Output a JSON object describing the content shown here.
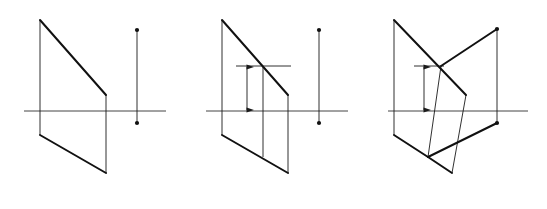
{
  "figure": {
    "kind": "descriptive-geometry-orthographic-projection",
    "background_color": "#ffffff",
    "stroke_color": "#1a1a1a",
    "thick_stroke_color": "#111111",
    "axis_color": "#444444",
    "panels": [
      {
        "id": "a",
        "caption": "(a)",
        "caption_x": 71,
        "caption_y": 190,
        "axis": {
          "left_label": "X",
          "right_label": "O",
          "left_label_x": 16,
          "right_label_x": 172,
          "label_y": 114,
          "x1": 24,
          "x2": 166,
          "y": 111
        },
        "points": [
          {
            "name": "a'",
            "x": 40,
            "y": 20,
            "label_x": 36,
            "label_y": 13,
            "dot": false
          },
          {
            "name": "b'",
            "x": 106,
            "y": 95,
            "label_x": 110,
            "label_y": 93,
            "dot": false
          },
          {
            "name": "a",
            "x": 40,
            "y": 135,
            "label_x": 33,
            "label_y": 139,
            "dot": false
          },
          {
            "name": "b",
            "x": 106,
            "y": 173,
            "label_x": 110,
            "label_y": 178,
            "dot": false
          },
          {
            "name": "c'",
            "x": 137,
            "y": 30,
            "label_x": 142,
            "label_y": 26,
            "dot": true
          },
          {
            "name": "c",
            "x": 137,
            "y": 123,
            "label_x": 142,
            "label_y": 128,
            "dot": true
          }
        ],
        "thick_segments": [
          {
            "from": "a'",
            "to": "b'"
          },
          {
            "from": "a",
            "to": "b"
          }
        ],
        "thin_segments": [
          {
            "from": "a'",
            "to": "a"
          },
          {
            "from": "b'",
            "to": "b"
          },
          {
            "from": "c'",
            "to": "c"
          }
        ],
        "dimension": null
      },
      {
        "id": "b",
        "caption": "(b)",
        "caption_x": 253,
        "caption_y": 190,
        "axis": {
          "left_label": "X",
          "right_label": "O",
          "left_label_x": 198,
          "right_label_x": 354,
          "label_y": 114,
          "x1": 206,
          "x2": 348,
          "y": 111
        },
        "points": [
          {
            "name": "a'",
            "x": 222,
            "y": 20,
            "label_x": 218,
            "label_y": 13,
            "dot": false
          },
          {
            "name": "b'",
            "x": 288,
            "y": 95,
            "label_x": 292,
            "label_y": 93,
            "dot": false
          },
          {
            "name": "d'",
            "x": 263,
            "y": 66,
            "label_x": 267,
            "label_y": 61,
            "dot": false
          },
          {
            "name": "a",
            "x": 222,
            "y": 135,
            "label_x": 215,
            "label_y": 139,
            "dot": false
          },
          {
            "name": "b",
            "x": 288,
            "y": 173,
            "label_x": 292,
            "label_y": 178,
            "dot": false
          },
          {
            "name": "d",
            "x": 263,
            "y": 157,
            "label_x": 259,
            "label_y": 167,
            "dot": false
          },
          {
            "name": "c'",
            "x": 319,
            "y": 30,
            "label_x": 324,
            "label_y": 26,
            "dot": true
          },
          {
            "name": "c",
            "x": 319,
            "y": 123,
            "label_x": 324,
            "label_y": 128,
            "dot": true
          }
        ],
        "thick_segments": [
          {
            "from": "a'",
            "to": "b'"
          },
          {
            "from": "a",
            "to": "b"
          }
        ],
        "thin_segments": [
          {
            "from": "a'",
            "to": "a"
          },
          {
            "from": "b'",
            "to": "b"
          },
          {
            "from": "c'",
            "to": "c"
          },
          {
            "from": "d'",
            "to": "d"
          }
        ],
        "dimension": {
          "value": "20",
          "reference_line": {
            "x1": 236,
            "x2": 291,
            "y": 66
          },
          "arrow_x": 247,
          "arrow_y_top": 66,
          "arrow_y_bottom": 111,
          "text_x": 243,
          "text_y": 91
        }
      },
      {
        "id": "c",
        "caption": "(c)",
        "caption_x": 435,
        "caption_y": 190,
        "axis": {
          "left_label": "X",
          "right_label": "O",
          "left_label_x": 380,
          "right_label_x": 534,
          "label_y": 114,
          "x1": 388,
          "x2": 528,
          "y": 111
        },
        "points": [
          {
            "name": "a'",
            "x": 394,
            "y": 20,
            "label_x": 390,
            "label_y": 13,
            "dot": false
          },
          {
            "name": "b'",
            "x": 466,
            "y": 95,
            "label_x": 470,
            "label_y": 93,
            "dot": false
          },
          {
            "name": "d'",
            "x": 441,
            "y": 66,
            "label_x": 445,
            "label_y": 61,
            "dot": false
          },
          {
            "name": "a",
            "x": 394,
            "y": 135,
            "label_x": 387,
            "label_y": 139,
            "dot": false
          },
          {
            "name": "b",
            "x": 452,
            "y": 173,
            "label_x": 456,
            "label_y": 178,
            "dot": false
          },
          {
            "name": "d",
            "x": 428,
            "y": 157,
            "label_x": 424,
            "label_y": 167,
            "dot": false
          },
          {
            "name": "c'",
            "x": 497,
            "y": 29,
            "label_x": 502,
            "label_y": 25,
            "dot": true
          },
          {
            "name": "c",
            "x": 497,
            "y": 123,
            "label_x": 502,
            "label_y": 128,
            "dot": true
          }
        ],
        "thick_segments": [
          {
            "from": "a'",
            "to": "b'"
          },
          {
            "from": "d'",
            "to": "c'"
          },
          {
            "from": "a",
            "to": "d"
          },
          {
            "from": "d",
            "to": "b"
          },
          {
            "from": "d",
            "to": "c"
          }
        ],
        "thin_segments": [
          {
            "from": "a'",
            "to": "a"
          },
          {
            "from": "b'",
            "to": "b"
          },
          {
            "from": "c'",
            "to": "c"
          },
          {
            "from": "d'",
            "to": "d"
          }
        ],
        "dimension": {
          "value": "20",
          "reference_line": {
            "x1": 414,
            "x2": 444,
            "y": 66
          },
          "arrow_x": 424,
          "arrow_y_top": 66,
          "arrow_y_bottom": 111,
          "text_x": 420,
          "text_y": 91
        }
      }
    ]
  }
}
